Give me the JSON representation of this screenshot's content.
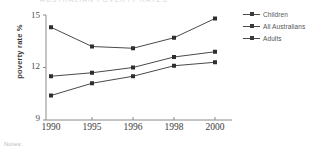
{
  "figure": {
    "cut_title": "AUSTRALIAN POVERTY RATES",
    "notes_label": "Notes:"
  },
  "chart_data": {
    "type": "line",
    "title": "",
    "xlabel": "",
    "ylabel": "poverty rate %",
    "categories": [
      "1990",
      "1995",
      "1996",
      "1998",
      "2000"
    ],
    "ylim": [
      9,
      15
    ],
    "yticks": [
      "9",
      "12",
      "15"
    ],
    "grid": false,
    "legend_position": "right",
    "marker": "square",
    "series": [
      {
        "name": "Children",
        "values": [
          14.3,
          13.2,
          13.1,
          13.7,
          14.8
        ]
      },
      {
        "name": "All Australians",
        "values": [
          11.5,
          11.7,
          12.0,
          12.6,
          12.9
        ]
      },
      {
        "name": "Adults",
        "values": [
          10.4,
          11.1,
          11.5,
          12.1,
          12.3
        ]
      }
    ],
    "colors": {
      "line": "#4a4a4a",
      "marker": "#2e2e2e",
      "axis": "#8a8a8a"
    }
  }
}
